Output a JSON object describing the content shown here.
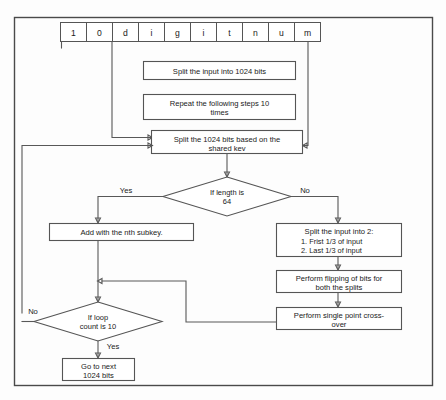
{
  "diagram": {
    "border_color": "#4a4a4a",
    "line_color": "#585858",
    "box_fill": "#ffffff",
    "text_color": "#1a1a1a"
  },
  "input_cells": [
    {
      "char": "1"
    },
    {
      "char": "0"
    },
    {
      "char": "d"
    },
    {
      "char": "i"
    },
    {
      "char": "g"
    },
    {
      "char": "i"
    },
    {
      "char": "t"
    },
    {
      "char": "n"
    },
    {
      "char": "u"
    },
    {
      "char": "m"
    }
  ],
  "nodes": {
    "split_1024": {
      "line1": "Split the input into 1024 bits"
    },
    "repeat_10": {
      "line1": "Repeat the following steps 10",
      "line2": "times"
    },
    "split_shared_key": {
      "line1": "Split the 1024 bits based on the",
      "line2": "shared kev"
    },
    "if_length_64": {
      "line1": "If length is",
      "line2": "64"
    },
    "add_subkey": {
      "line1": "Add with the nth subkey."
    },
    "split_into_2": {
      "line1": "Split the input into 2:",
      "item1": "1. Frist 1/3 of input",
      "item2": "2. Last 1/3 of input"
    },
    "flip_bits": {
      "line1": "Perform flipping of bits for",
      "line2": "both the splits"
    },
    "crossover": {
      "line1": "Perform single point cross-",
      "line2": "over"
    },
    "if_loop_10": {
      "line1": "If loop",
      "line2": "count is 10"
    },
    "go_next": {
      "line1": "Go to next",
      "line2": "1024 bits"
    }
  },
  "edge_labels": {
    "length_yes": "Yes",
    "length_no": "No",
    "loop_no": "No",
    "loop_yes": "Yes"
  }
}
